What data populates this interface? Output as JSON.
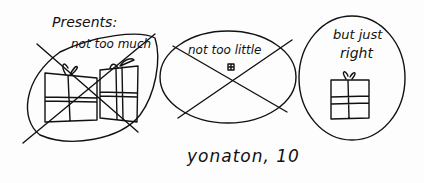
{
  "title": "Presents:",
  "panels": [
    {
      "caption": "not too much",
      "crossed": true,
      "gifts": 2
    },
    {
      "caption": "not too little",
      "crossed": true,
      "gifts": 1
    },
    {
      "caption_line1": "but just",
      "caption_line2": "right",
      "crossed": false,
      "gifts": 1
    }
  ],
  "signature": "yonaton, 10",
  "colors": {
    "ink": "#111111",
    "paper": "#fdfdfd"
  }
}
